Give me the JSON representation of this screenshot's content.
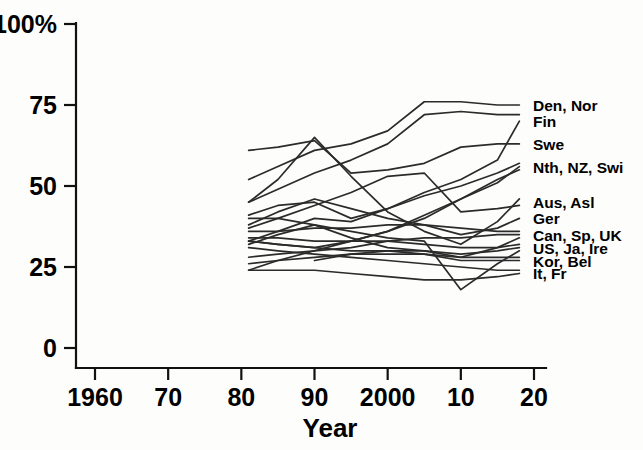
{
  "chart_data": {
    "type": "line",
    "title": "",
    "xlabel": "Year",
    "ylabel": "",
    "xlim": [
      1960,
      2020
    ],
    "ylim": [
      0,
      100
    ],
    "grid": false,
    "legend_position": "right-of-plot-line-ends",
    "x_tick_labels": [
      "1960",
      "70",
      "80",
      "90",
      "2000",
      "10",
      "20"
    ],
    "x_tick_values": [
      1960,
      1970,
      1980,
      1990,
      2000,
      2010,
      2020
    ],
    "y_tick_labels": [
      "0",
      "25",
      "50",
      "75",
      "100%"
    ],
    "y_tick_values": [
      0,
      25,
      50,
      75,
      100
    ],
    "series": [
      {
        "name": "Den",
        "legend_label": "Den, Nor",
        "legend_y_value": 76,
        "x": [
          1981,
          1985,
          1990,
          1995,
          2000,
          2005,
          2010,
          2015,
          2018
        ],
        "values": [
          52,
          56,
          61,
          63,
          67,
          76,
          76,
          75,
          75
        ]
      },
      {
        "name": "Nor",
        "legend_label": "Den, Nor",
        "legend_y_value": 73,
        "x": [
          1981,
          1985,
          1990,
          1995,
          2000,
          2005,
          2010,
          2015,
          2018
        ],
        "values": [
          45,
          49,
          54,
          58,
          63,
          72,
          73,
          72,
          72
        ]
      },
      {
        "name": "Fin",
        "legend_label": "Fin",
        "legend_y_value": 70,
        "x": [
          1981,
          1985,
          1990,
          1995,
          2000,
          2005,
          2010,
          2015,
          2018
        ],
        "values": [
          33,
          36,
          40,
          39,
          43,
          48,
          52,
          58,
          70
        ]
      },
      {
        "name": "Swe",
        "legend_label": "Swe",
        "legend_y_value": 63,
        "x": [
          1981,
          1985,
          1990,
          1995,
          2000,
          2005,
          2010,
          2015,
          2018
        ],
        "values": [
          61,
          62,
          64,
          54,
          55,
          57,
          62,
          63,
          63
        ]
      },
      {
        "name": "Nth",
        "legend_label": "Nth, NZ, Swi",
        "legend_y_value": 57,
        "x": [
          1981,
          1985,
          1990,
          1995,
          2000,
          2005,
          2010,
          2015,
          2018
        ],
        "values": [
          41,
          44,
          45,
          40,
          43,
          47,
          50,
          54,
          57
        ]
      },
      {
        "name": "NZ",
        "legend_label": "Nth, NZ, Swi",
        "legend_y_value": 56,
        "x": [
          1981,
          1985,
          1990,
          1995,
          2000,
          2005,
          2010,
          2015,
          2018
        ],
        "values": [
          33,
          32,
          31,
          33,
          36,
          40,
          46,
          51,
          56
        ]
      },
      {
        "name": "Swi",
        "legend_label": "Nth, NZ, Swi",
        "legend_y_value": 55,
        "x": [
          1981,
          1985,
          1990,
          1995,
          2000,
          2005,
          2010,
          2015,
          2018
        ],
        "values": [
          24,
          27,
          30,
          33,
          36,
          41,
          46,
          52,
          55
        ]
      },
      {
        "name": "Aus",
        "legend_label": "Aus, Asl",
        "legend_y_value": 46,
        "x": [
          1981,
          1985,
          1990,
          1995,
          2000,
          2005,
          2010,
          2015,
          2018
        ],
        "values": [
          45,
          52,
          65,
          53,
          42,
          36,
          32,
          39,
          46
        ]
      },
      {
        "name": "Asl",
        "legend_label": "Aus, Asl",
        "legend_y_value": 44,
        "x": [
          1981,
          1985,
          1990,
          1995,
          2000,
          2005,
          2010,
          2015,
          2018
        ],
        "values": [
          37,
          40,
          44,
          48,
          53,
          54,
          42,
          43,
          44
        ]
      },
      {
        "name": "Ger",
        "legend_label": "Ger",
        "legend_y_value": 40,
        "x": [
          1981,
          1985,
          1990,
          1995,
          2000,
          2005,
          2010,
          2015,
          2018
        ],
        "values": [
          38,
          42,
          46,
          43,
          40,
          38,
          35,
          37,
          40
        ]
      },
      {
        "name": "Can",
        "legend_label": "Can, Sp, UK",
        "legend_y_value": 36,
        "x": [
          1981,
          1985,
          1990,
          1995,
          2000,
          2005,
          2010,
          2015,
          2018
        ],
        "values": [
          36,
          36,
          37,
          37,
          38,
          38,
          37,
          36,
          36
        ]
      },
      {
        "name": "Sp",
        "legend_label": "Can, Sp, UK",
        "legend_y_value": 35,
        "x": [
          1981,
          1985,
          1990,
          1995,
          2000,
          2005,
          2010,
          2015,
          2018
        ],
        "values": [
          28,
          29,
          30,
          31,
          33,
          34,
          34,
          35,
          35
        ]
      },
      {
        "name": "UK",
        "legend_label": "Can, Sp, UK",
        "legend_y_value": 34,
        "x": [
          1981,
          1985,
          1990,
          1995,
          2000,
          2005,
          2010,
          2015,
          2018
        ],
        "values": [
          40,
          40,
          38,
          34,
          31,
          30,
          28,
          31,
          34
        ]
      },
      {
        "name": "US",
        "legend_label": "US, Ja, Ire",
        "legend_y_value": 32,
        "x": [
          1981,
          1985,
          1990,
          1995,
          2000,
          2005,
          2010,
          2015,
          2018
        ],
        "values": [
          34,
          34,
          33,
          33,
          33,
          32,
          31,
          31,
          32
        ]
      },
      {
        "name": "Ja",
        "legend_label": "US, Ja, Ire",
        "legend_y_value": 31,
        "x": [
          1981,
          1985,
          1990,
          1995,
          2000,
          2005,
          2010,
          2015,
          2018
        ],
        "values": [
          26,
          27,
          28,
          29,
          30,
          30,
          29,
          30,
          31
        ]
      },
      {
        "name": "Ire",
        "legend_label": "US, Ja, Ire",
        "legend_y_value": 30,
        "x": [
          1981,
          1985,
          1990,
          1995,
          2000,
          2005,
          2010,
          2015,
          2018
        ],
        "values": [
          32,
          35,
          38,
          36,
          34,
          33,
          18,
          26,
          30
        ]
      },
      {
        "name": "Kor",
        "legend_label": "Kor, Bel",
        "legend_y_value": 28,
        "x": [
          1990,
          1995,
          2000,
          2005,
          2010,
          2015,
          2018
        ],
        "values": [
          27,
          29,
          29,
          29,
          28,
          28,
          28
        ]
      },
      {
        "name": "Bel",
        "legend_label": "Kor, Bel",
        "legend_y_value": 27,
        "x": [
          1981,
          1985,
          1990,
          1995,
          2000,
          2005,
          2010,
          2015,
          2018
        ],
        "values": [
          33,
          32,
          31,
          30,
          30,
          29,
          27,
          27,
          27
        ]
      },
      {
        "name": "It",
        "legend_label": "It, Fr",
        "legend_y_value": 24,
        "x": [
          1981,
          1985,
          1990,
          1995,
          2000,
          2005,
          2010,
          2015,
          2018
        ],
        "values": [
          31,
          30,
          29,
          28,
          27,
          26,
          25,
          24,
          24
        ]
      },
      {
        "name": "Fr",
        "legend_label": "It, Fr",
        "legend_y_value": 23,
        "x": [
          1981,
          1985,
          1990,
          1995,
          2000,
          2005,
          2010,
          2015,
          2018
        ],
        "values": [
          24,
          24,
          24,
          23,
          22,
          21,
          21,
          22,
          23
        ]
      }
    ],
    "legend_entries": [
      {
        "label": "Den, Nor",
        "y_value": 75
      },
      {
        "label": "Fin",
        "y_value": 70
      },
      {
        "label": "Swe",
        "y_value": 63
      },
      {
        "label": "Nth, NZ, Swi",
        "y_value": 56
      },
      {
        "label": "Aus, Asl",
        "y_value": 45
      },
      {
        "label": "Ger",
        "y_value": 40
      },
      {
        "label": "Can, Sp, UK",
        "y_value": 35
      },
      {
        "label": "US, Ja, Ire",
        "y_value": 31
      },
      {
        "label": "Kor, Bel",
        "y_value": 27
      },
      {
        "label": "It, Fr",
        "y_value": 23
      }
    ]
  }
}
